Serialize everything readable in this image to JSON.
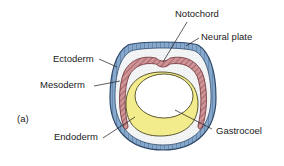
{
  "figure": {
    "panel_label": "(a)",
    "labels": {
      "notochord": "Notochord",
      "neural_plate": "Neural plate",
      "ectoderm": "Ectoderm",
      "mesoderm": "Mesoderm",
      "endoderm": "Endoderm",
      "gastrocoel": "Gastrocoel"
    },
    "colors": {
      "ectoderm": "#7fa3c8",
      "ectoderm_outline": "#2f4a6b",
      "mesoderm": "#c98c8f",
      "mesoderm_outline": "#6b2f33",
      "endoderm": "#f3ec8c",
      "endoderm_outline": "#5a5520",
      "blastocoel_stipple": "#e9ecef",
      "gastrocoel": "#ffffff"
    }
  }
}
